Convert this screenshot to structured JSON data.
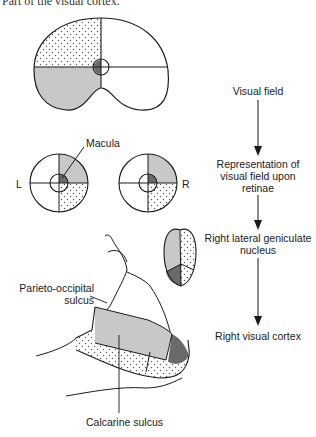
{
  "caption_fragment": "Part of the visual cortex.",
  "labels": {
    "macula": "Macula",
    "left_eye": "L",
    "right_eye": "R",
    "parieto_occipital": [
      "Parieto-occipital",
      "sulcus"
    ],
    "calcarine": "Calcarine sulcus"
  },
  "flow": [
    {
      "text": "Visual field"
    },
    {
      "text": "Representation of visual field upon retinae"
    },
    {
      "text": "Right lateral geniculate nucleus"
    },
    {
      "text": "Right visual cortex"
    }
  ],
  "colors": {
    "gray_fill": "#c8c8c8",
    "dark_fill": "#6a6a6a",
    "line": "#1a1a1a",
    "dot": "#555555"
  }
}
